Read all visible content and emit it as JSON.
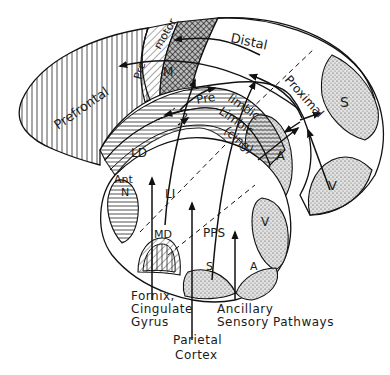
{
  "diagram": {
    "regions": {
      "prefrontal": "Prefrontal",
      "premotor_pre": "Pre",
      "premotor_motor": "motor",
      "motor": "M",
      "distal": "Distal",
      "proximal": "Proximal",
      "somatic_cortex": "S",
      "visual_cortex": "V",
      "auditory_cortex": "A",
      "prelimbic_pre": "Pre",
      "prelimbic_limbic": "limbic",
      "limbic": "Limbic",
      "cing": "(cing)",
      "question": "?",
      "ld": "LD",
      "li": "LI",
      "ant_n_1": "Ant",
      "ant_n_2": "N",
      "md": "MD",
      "pps": "PPS",
      "thal_visual": "V",
      "thal_somatic": "S",
      "thal_auditory": "A"
    },
    "inputs": {
      "fornix": [
        "Fornix,",
        "Cingulate",
        "Gyrus"
      ],
      "parietal": [
        "Parietal",
        "Cortex"
      ],
      "ancillary": [
        "Ancillary",
        "Sensory Pathways"
      ]
    }
  }
}
